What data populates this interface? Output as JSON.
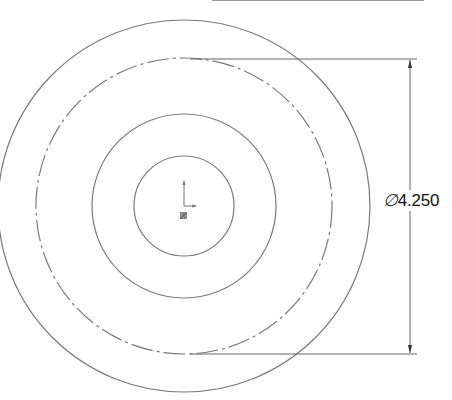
{
  "drawing": {
    "type": "concentric circles sketch",
    "center": {
      "x": 184,
      "y": 206
    },
    "circles": [
      {
        "name": "outer",
        "radius": 186,
        "style": "solid"
      },
      {
        "name": "construction",
        "radius": 148,
        "style": "dash-dot"
      },
      {
        "name": "middle",
        "radius": 92,
        "style": "solid"
      },
      {
        "name": "inner",
        "radius": 50,
        "style": "solid"
      }
    ],
    "line_color": "#7a7a7a"
  },
  "dimension": {
    "symbol": "∅",
    "value": "4.250",
    "label": "∅4.250",
    "target": "construction circle diameter"
  },
  "origin_marker": {
    "icon": "origin-axes-icon"
  }
}
